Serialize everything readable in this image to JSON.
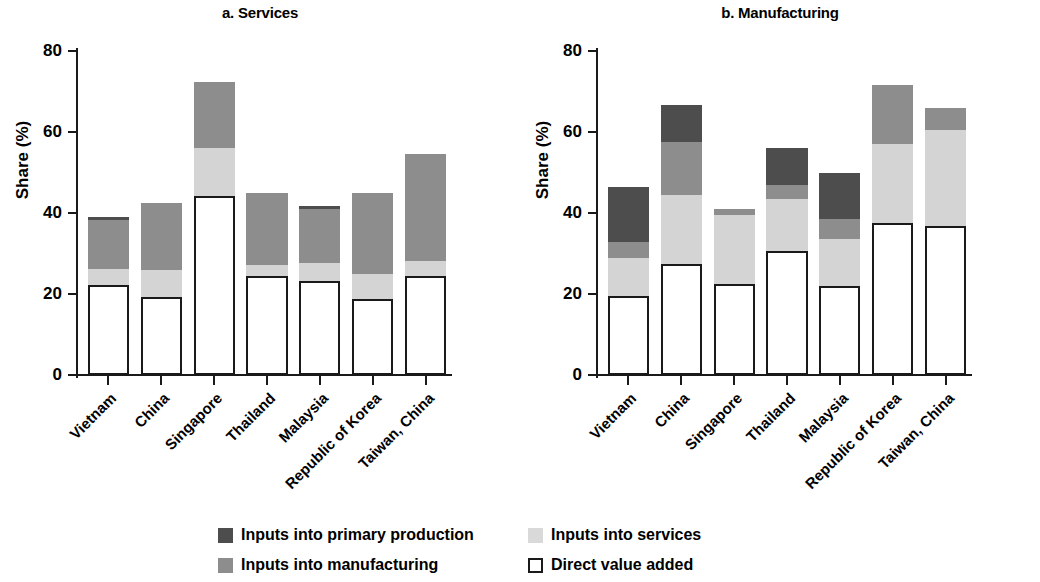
{
  "figure": {
    "panels": [
      {
        "title": "a. Services",
        "key": "services"
      },
      {
        "title": "b. Manufacturing",
        "key": "manufacturing"
      }
    ],
    "ylabel": "Share (%)",
    "yticks": [
      "0",
      "20",
      "40",
      "60",
      "80"
    ]
  },
  "legend": {
    "items": [
      {
        "label": "Inputs into primary production",
        "swatch": "prim",
        "color": "#4d4d4d"
      },
      {
        "label": "Inputs into services",
        "swatch": "serv",
        "color": "#d9d9d9"
      },
      {
        "label": "Inputs into manufacturing",
        "swatch": "manu",
        "color": "#8d8d8d"
      },
      {
        "label": "Direct value added",
        "swatch": "dva",
        "color": "#ffffff"
      }
    ]
  },
  "chart_data": [
    {
      "type": "bar",
      "stacked": true,
      "title": "a. Services",
      "xlabel": "",
      "ylabel": "Share (%)",
      "ylim": [
        0,
        80
      ],
      "yticks": [
        0,
        20,
        40,
        60,
        80
      ],
      "grid": false,
      "legend_position": "bottom",
      "categories": [
        "Vietnam",
        "China",
        "Singapore",
        "Thailand",
        "Malaysia",
        "Republic of Korea",
        "Taiwan, China"
      ],
      "series": [
        {
          "name": "Direct value added",
          "color": "#ffffff",
          "values": [
            22.2,
            19.2,
            44.2,
            24.5,
            23.2,
            18.7,
            24.5
          ]
        },
        {
          "name": "Inputs into services",
          "color": "#d9d9d9",
          "values": [
            4.0,
            6.8,
            11.8,
            2.6,
            4.4,
            6.2,
            3.6
          ]
        },
        {
          "name": "Inputs into manufacturing",
          "color": "#8d8d8d",
          "values": [
            12.0,
            16.5,
            16.4,
            17.8,
            13.5,
            20.1,
            26.4
          ]
        },
        {
          "name": "Inputs into primary production",
          "color": "#4d4d4d",
          "values": [
            0.9,
            0.0,
            0.0,
            0.0,
            0.7,
            0.0,
            0.0
          ]
        }
      ],
      "totals": [
        39.1,
        42.5,
        72.4,
        44.9,
        41.8,
        45.0,
        54.5
      ]
    },
    {
      "type": "bar",
      "stacked": true,
      "title": "b. Manufacturing",
      "xlabel": "",
      "ylabel": "Share (%)",
      "ylim": [
        0,
        80
      ],
      "yticks": [
        0,
        20,
        40,
        60,
        80
      ],
      "grid": false,
      "legend_position": "bottom",
      "categories": [
        "Vietnam",
        "China",
        "Singapore",
        "Thailand",
        "Malaysia",
        "Republic of Korea",
        "Taiwan, China"
      ],
      "series": [
        {
          "name": "Direct value added",
          "color": "#ffffff",
          "values": [
            19.6,
            27.5,
            22.4,
            30.6,
            21.9,
            37.5,
            36.8
          ]
        },
        {
          "name": "Inputs into services",
          "color": "#d9d9d9",
          "values": [
            9.4,
            17.0,
            17.1,
            12.9,
            11.6,
            19.5,
            23.7
          ]
        },
        {
          "name": "Inputs into manufacturing",
          "color": "#8d8d8d",
          "values": [
            3.9,
            13.0,
            1.5,
            3.5,
            5.0,
            14.5,
            5.5
          ]
        },
        {
          "name": "Inputs into primary production",
          "color": "#4d4d4d",
          "values": [
            13.6,
            9.1,
            0.0,
            9.0,
            11.5,
            0.0,
            0.0
          ]
        }
      ],
      "totals": [
        46.5,
        66.6,
        41.0,
        56.0,
        50.0,
        71.5,
        66.0
      ]
    }
  ]
}
